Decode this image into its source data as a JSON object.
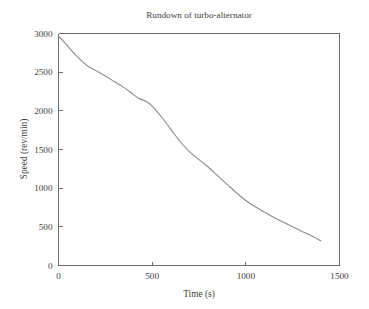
{
  "chart_data": {
    "type": "line",
    "title": "Rundown of turbo-alternator",
    "xlabel": "Time (s)",
    "ylabel": "Speed (rev/min)",
    "xlim": [
      0,
      1500
    ],
    "ylim": [
      0,
      3000
    ],
    "xticks": [
      0,
      500,
      1000,
      1500
    ],
    "yticks": [
      0,
      500,
      1000,
      1500,
      2000,
      2500,
      3000
    ],
    "xtick_labels": [
      "0",
      "500",
      "1000",
      "1500"
    ],
    "ytick_labels": [
      "0",
      "500",
      "1000",
      "1500",
      "2000",
      "2500",
      "3000"
    ],
    "grid": false,
    "legend": null,
    "line_color": "#8a8a8a",
    "background_color": "#ffffff",
    "axis_color": "#6e6e6e",
    "series": [
      {
        "name": "Speed",
        "x": [
          0,
          50,
          100,
          150,
          200,
          250,
          300,
          350,
          400,
          430,
          470,
          500,
          550,
          600,
          650,
          700,
          750,
          800,
          850,
          900,
          950,
          1000,
          1050,
          1100,
          1150,
          1200,
          1250,
          1300,
          1350,
          1400
        ],
        "values": [
          2970,
          2835,
          2700,
          2590,
          2520,
          2450,
          2375,
          2300,
          2210,
          2160,
          2120,
          2060,
          1920,
          1760,
          1600,
          1470,
          1370,
          1270,
          1160,
          1050,
          940,
          840,
          760,
          690,
          620,
          560,
          500,
          440,
          385,
          320
        ]
      }
    ]
  },
  "figure": {
    "title_text": "Rundown of turbo-alternator"
  }
}
